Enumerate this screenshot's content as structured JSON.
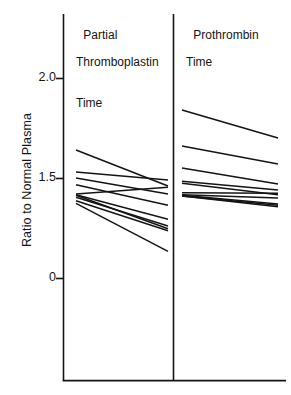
{
  "axis": {
    "ylabel": "Ratio to Normal Plasma",
    "ticks": [
      {
        "label": "2.0",
        "value": 2.0,
        "y": 78
      },
      {
        "label": "1.5",
        "value": 1.5,
        "y": 178
      },
      {
        "label": "0",
        "value": 0.0,
        "y": 278
      }
    ]
  },
  "panels": [
    {
      "name": "partial-thromboplastin-time",
      "title_lines": [
        "Partial",
        "Thromboplastin",
        "Time"
      ]
    },
    {
      "name": "prothrombin-time",
      "title_lines": [
        "Prothrombin",
        "Time"
      ]
    }
  ],
  "colors": {
    "line": "#141414",
    "axis": "#141414",
    "background": "#ffffff"
  },
  "chart_data": {
    "type": "line",
    "title": "",
    "subtitle": "",
    "xlabel": "",
    "ylabel": "Ratio to Normal Plasma",
    "ytick_labels": [
      "2.0",
      "1.5",
      "0"
    ],
    "ytick_values": [
      2.0,
      1.5,
      0.0
    ],
    "ylim": [
      0.0,
      2.25
    ],
    "grid": false,
    "legend": "none",
    "note": "Paired before/after slope chart. Each panel has two implicit x categories (pre, post) and each line joins one subject's pre value to the post value. Y axis is broken: equal pixel spacing between 0, 1.5 and 2.0.",
    "panels": [
      {
        "name": "Partial Thromboplastin Time",
        "categories": [
          "pre",
          "post"
        ],
        "series": [
          {
            "name": "subject-1",
            "values": [
              1.64,
              1.38
            ]
          },
          {
            "name": "subject-2",
            "values": [
              1.53,
              1.47
            ]
          },
          {
            "name": "subject-3",
            "values": [
              1.5,
              1.26
            ]
          },
          {
            "name": "subject-4",
            "values": [
              1.4,
              1.09
            ]
          },
          {
            "name": "subject-5",
            "values": [
              1.26,
              1.36
            ]
          },
          {
            "name": "subject-6",
            "values": [
              1.25,
              0.88
            ]
          },
          {
            "name": "subject-7",
            "values": [
              1.24,
              0.74
            ]
          },
          {
            "name": "subject-8",
            "values": [
              1.21,
              0.78
            ]
          },
          {
            "name": "subject-9",
            "values": [
              1.16,
              0.71
            ]
          },
          {
            "name": "subject-10",
            "values": [
              1.12,
              0.4
            ]
          }
        ]
      },
      {
        "name": "Prothrombin Time",
        "categories": [
          "pre",
          "post"
        ],
        "series": [
          {
            "name": "subject-1",
            "values": [
              1.84,
              1.7
            ]
          },
          {
            "name": "subject-2",
            "values": [
              1.66,
              1.57
            ]
          },
          {
            "name": "subject-3",
            "values": [
              1.55,
              1.41
            ]
          },
          {
            "name": "subject-4",
            "values": [
              1.45,
              1.32
            ]
          },
          {
            "name": "subject-5",
            "values": [
              1.42,
              1.25
            ]
          },
          {
            "name": "subject-6",
            "values": [
              1.28,
              1.27
            ]
          },
          {
            "name": "subject-7",
            "values": [
              1.25,
              1.2
            ]
          },
          {
            "name": "subject-8",
            "values": [
              1.24,
              1.11
            ]
          },
          {
            "name": "subject-9",
            "values": [
              1.23,
              1.09
            ]
          },
          {
            "name": "subject-10",
            "values": [
              1.23,
              1.07
            ]
          }
        ]
      }
    ]
  }
}
